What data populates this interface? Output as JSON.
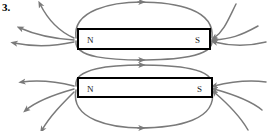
{
  "figure": {
    "problem_number": "3.",
    "type": "bar-magnet-field-line-diagram",
    "background_color": "#ffffff",
    "field_line_color": "#7a7a7a",
    "magnet_border_color": "#000000",
    "magnet_fill_color": "#ffffff",
    "label_color": "#1a1a1a"
  },
  "magnets": [
    {
      "id": "magnet-top",
      "north_label": "N",
      "south_label": "S"
    },
    {
      "id": "magnet-bottom",
      "north_label": "N",
      "south_label": "S"
    }
  ],
  "field_lines": {
    "description": "Magnetic field lines looping from N pole around to S pole on each bar magnet",
    "arrow_direction": "N-to-S outside the magnet",
    "loops_per_magnet": 2,
    "side_curves_per_magnet": 4
  }
}
